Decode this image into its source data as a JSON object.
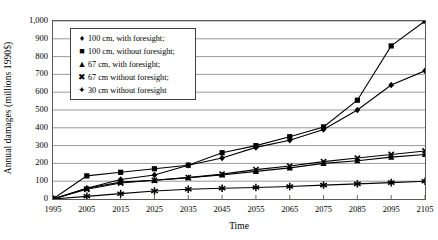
{
  "chart_data": {
    "type": "line",
    "title": "",
    "xlabel": "Time",
    "ylabel": "Annual damages (millions 1990$)",
    "x": [
      1995,
      2005,
      2015,
      2025,
      2035,
      2045,
      2055,
      2065,
      2075,
      2085,
      2095,
      2105
    ],
    "xlim": [
      1995,
      2105
    ],
    "ylim": [
      0,
      1000
    ],
    "ytick_labels": [
      "0",
      "100",
      "200",
      "300",
      "400",
      "500",
      "600",
      "700",
      "800",
      "900",
      "1,000"
    ],
    "yticks": [
      0,
      100,
      200,
      300,
      400,
      500,
      600,
      700,
      800,
      900,
      1000
    ],
    "xtick_labels": [
      "1995",
      "2005",
      "2015",
      "2025",
      "2035",
      "2045",
      "2055",
      "2065",
      "2075",
      "2085",
      "2095",
      "2105"
    ],
    "grid": true,
    "legend_position": "upper-left-inside",
    "series": [
      {
        "name": "100 cm, with foresight;",
        "marker": "diamond",
        "values": [
          0,
          60,
          110,
          135,
          190,
          230,
          290,
          330,
          390,
          500,
          640,
          720
        ]
      },
      {
        "name": "100 cm, without foresight;",
        "marker": "square",
        "values": [
          0,
          130,
          150,
          170,
          190,
          260,
          300,
          350,
          405,
          555,
          860,
          1000
        ]
      },
      {
        "name": "67 cm, with foresight;",
        "marker": "triangle",
        "values": [
          0,
          60,
          95,
          105,
          120,
          135,
          155,
          175,
          200,
          215,
          235,
          250
        ]
      },
      {
        "name": "67 cm without foresight;",
        "marker": "cross",
        "values": [
          0,
          55,
          90,
          105,
          120,
          140,
          165,
          185,
          210,
          230,
          250,
          270
        ]
      },
      {
        "name": "30 cm without foresight",
        "marker": "star",
        "values": [
          0,
          15,
          30,
          45,
          55,
          60,
          65,
          70,
          78,
          85,
          92,
          100
        ]
      }
    ]
  },
  "markers": {
    "diamond": "♦",
    "square": "■",
    "triangle": "▲",
    "cross": "✖",
    "star": "✦"
  }
}
